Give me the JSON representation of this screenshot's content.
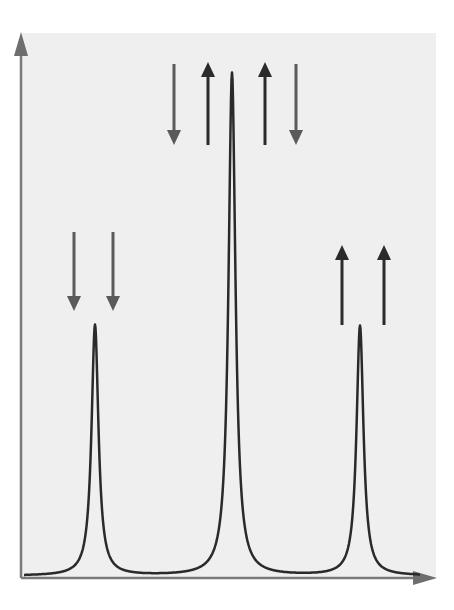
{
  "diagram": {
    "type": "spectrum",
    "colors": {
      "panel_bg": "#efefef",
      "axis": "#7a7a7a",
      "curve": "#2a2a2a",
      "arrow_dark": "#2b2b2b",
      "arrow_gray": "#5a5a5a"
    },
    "axes": {
      "x_label": "",
      "y_label": ""
    },
    "peaks": [
      {
        "name": "left",
        "x": 95,
        "peak_y": 325,
        "relative_height": 0.5
      },
      {
        "name": "center",
        "x": 232,
        "peak_y": 73,
        "relative_height": 1.0
      },
      {
        "name": "right",
        "x": 360,
        "peak_y": 326,
        "relative_height": 0.5
      }
    ],
    "arrow_groups": [
      {
        "peak": "left",
        "arrows": [
          {
            "x": 74,
            "y1": 232,
            "y2": 311,
            "direction": "down"
          },
          {
            "x": 113,
            "y1": 232,
            "y2": 311,
            "direction": "down"
          }
        ]
      },
      {
        "peak": "center",
        "arrows": [
          {
            "x": 174,
            "y1": 64,
            "y2": 145,
            "direction": "down"
          },
          {
            "x": 208,
            "y1": 62,
            "y2": 145,
            "direction": "up"
          },
          {
            "x": 265,
            "y1": 62,
            "y2": 145,
            "direction": "up"
          },
          {
            "x": 296,
            "y1": 64,
            "y2": 145,
            "direction": "down"
          }
        ]
      },
      {
        "peak": "right",
        "arrows": [
          {
            "x": 342,
            "y1": 245,
            "y2": 325,
            "direction": "up"
          },
          {
            "x": 384,
            "y1": 245,
            "y2": 325,
            "direction": "up"
          }
        ]
      }
    ]
  }
}
